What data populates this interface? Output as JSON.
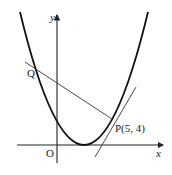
{
  "figure": {
    "labels": {
      "y_axis": "y",
      "x_axis": "x",
      "origin": "O",
      "point_q": "Q",
      "point_p": "P(5, 4)"
    },
    "point_p": {
      "x": 5,
      "y": 4
    },
    "curve": "parabola (upward, vertex on x-axis)",
    "lines": [
      "tangent at P",
      "normal at P through Q"
    ]
  }
}
